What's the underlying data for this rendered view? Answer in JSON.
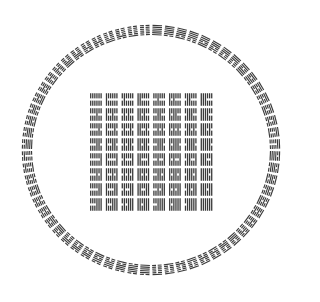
{
  "diagram": {
    "note": "Line patterns reconstructed from the canonical Fu Xi binary ordering; the source image is too low-resolution to read individual hexagram lines.",
    "ink_color": "#3a3a3a",
    "background_color": "#ffffff",
    "circle": {
      "count": 64,
      "ordering": "Fu Xi binary sequence (canonical, assumed)",
      "hexagrams": [
        "111111",
        "111110",
        "111101",
        "111100",
        "111011",
        "111010",
        "111001",
        "111000",
        "110111",
        "110110",
        "110101",
        "110100",
        "110011",
        "110010",
        "110001",
        "110000",
        "101111",
        "101110",
        "101101",
        "101100",
        "101011",
        "101010",
        "101001",
        "101000",
        "100111",
        "100110",
        "100101",
        "100100",
        "100011",
        "100010",
        "100001",
        "100000",
        "011111",
        "011110",
        "011101",
        "011100",
        "011011",
        "011010",
        "011001",
        "011000",
        "010111",
        "010110",
        "010101",
        "010100",
        "010011",
        "010010",
        "010001",
        "010000",
        "001111",
        "001110",
        "001101",
        "001100",
        "001011",
        "001010",
        "001001",
        "001000",
        "000111",
        "000110",
        "000101",
        "000100",
        "000011",
        "000010",
        "000001",
        "000000"
      ]
    },
    "square": {
      "rows": 8,
      "cols": 8,
      "ordering": "Shao Yong square (canonical, assumed): Kun at top-left, Qian at bottom-right",
      "hexagrams": [
        [
          "000000",
          "000001",
          "000010",
          "000011",
          "000100",
          "000101",
          "000110",
          "000111"
        ],
        [
          "001000",
          "001001",
          "001010",
          "001011",
          "001100",
          "001101",
          "001110",
          "001111"
        ],
        [
          "010000",
          "010001",
          "010010",
          "010011",
          "010100",
          "010101",
          "010110",
          "010111"
        ],
        [
          "011000",
          "011001",
          "011010",
          "011011",
          "011100",
          "011101",
          "011110",
          "011111"
        ],
        [
          "100000",
          "100001",
          "100010",
          "100011",
          "100100",
          "100101",
          "100110",
          "100111"
        ],
        [
          "101000",
          "101001",
          "101010",
          "101011",
          "101100",
          "101101",
          "101110",
          "101111"
        ],
        [
          "110000",
          "110001",
          "110010",
          "110011",
          "110100",
          "110101",
          "110110",
          "110111"
        ],
        [
          "111000",
          "111001",
          "111010",
          "111011",
          "111100",
          "111101",
          "111110",
          "111111"
        ]
      ]
    }
  }
}
